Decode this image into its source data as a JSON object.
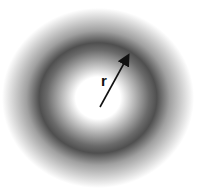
{
  "diagram": {
    "radius_label": "r",
    "colors": {
      "ring": "#4a4a4a",
      "background": "#ffffff",
      "arrow": "#111111"
    }
  }
}
